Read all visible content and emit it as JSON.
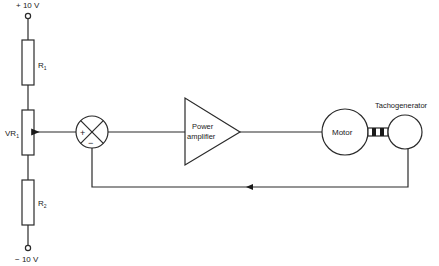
{
  "diagram": {
    "supply": {
      "top_label": "+ 10 V",
      "bottom_label": "− 10 V"
    },
    "resistors": [
      {
        "id": "R1",
        "label": "R",
        "sub": "1"
      },
      {
        "id": "VR1",
        "label": "VR",
        "sub": "1"
      },
      {
        "id": "R2",
        "label": "R",
        "sub": "2"
      }
    ],
    "summing_junction": {
      "plus": "+",
      "minus": "−"
    },
    "blocks": {
      "amplifier": {
        "line1": "Power",
        "line2": "amplifier"
      },
      "motor": {
        "label": "Motor"
      },
      "tachogenerator": {
        "label": "Tachogenerator"
      }
    },
    "colors": {
      "line": "#2a2a2a",
      "background": "#ffffff"
    }
  }
}
